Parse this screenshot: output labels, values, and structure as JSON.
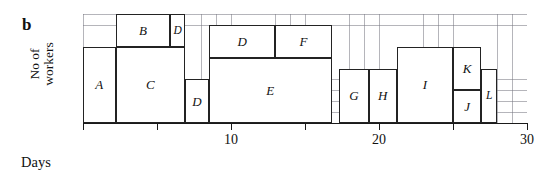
{
  "panel": {
    "letter": "b"
  },
  "axes": {
    "ylabel_line1": "No of",
    "ylabel_line2": "workers",
    "xlabel": "Days",
    "xmin": 0,
    "xmax": 30,
    "tick_values": [
      0,
      5,
      10,
      15,
      20,
      25,
      30
    ],
    "tick_labels": [
      "",
      "",
      "10",
      "",
      "20",
      "",
      "30"
    ],
    "ymin": 0,
    "ymax": 10,
    "grid": true,
    "grid_step_x": 1,
    "grid_step_y": 1
  },
  "chart_data": {
    "type": "bar",
    "subtype": "resource-histogram",
    "title": "",
    "xlabel": "Days",
    "ylabel": "No of workers",
    "xlim": [
      0,
      30
    ],
    "ylim": [
      0,
      10
    ],
    "grid": true,
    "legend": "none",
    "note": "Each rectangle is an activity block: start/finish on the Days axis and a worker-count band on the vertical axis.",
    "blocks": [
      {
        "label": "A",
        "start": 0,
        "finish": 2.2,
        "y_bottom": 0,
        "y_top": 7
      },
      {
        "label": "B",
        "start": 2.2,
        "finish": 5.9,
        "y_bottom": 7,
        "y_top": 10
      },
      {
        "label": "D",
        "start": 5.9,
        "finish": 6.9,
        "y_bottom": 7,
        "y_top": 10
      },
      {
        "label": "C",
        "start": 2.2,
        "finish": 6.9,
        "y_bottom": 0,
        "y_top": 7
      },
      {
        "label": "D",
        "start": 6.9,
        "finish": 8.5,
        "y_bottom": 0,
        "y_top": 4
      },
      {
        "label": "D",
        "start": 8.5,
        "finish": 13.0,
        "y_bottom": 6,
        "y_top": 9
      },
      {
        "label": "F",
        "start": 13.0,
        "finish": 16.8,
        "y_bottom": 6,
        "y_top": 9
      },
      {
        "label": "E",
        "start": 8.5,
        "finish": 16.8,
        "y_bottom": 0,
        "y_top": 6
      },
      {
        "label": "G",
        "start": 17.3,
        "finish": 19.3,
        "y_bottom": 0,
        "y_top": 5
      },
      {
        "label": "H",
        "start": 19.3,
        "finish": 21.2,
        "y_bottom": 0,
        "y_top": 5
      },
      {
        "label": "I",
        "start": 21.2,
        "finish": 25.0,
        "y_bottom": 0,
        "y_top": 7
      },
      {
        "label": "K",
        "start": 25.0,
        "finish": 26.9,
        "y_bottom": 3,
        "y_top": 7
      },
      {
        "label": "J",
        "start": 25.0,
        "finish": 26.9,
        "y_bottom": 0,
        "y_top": 3
      },
      {
        "label": "L",
        "start": 26.9,
        "finish": 28.0,
        "y_bottom": 0,
        "y_top": 5
      }
    ]
  }
}
